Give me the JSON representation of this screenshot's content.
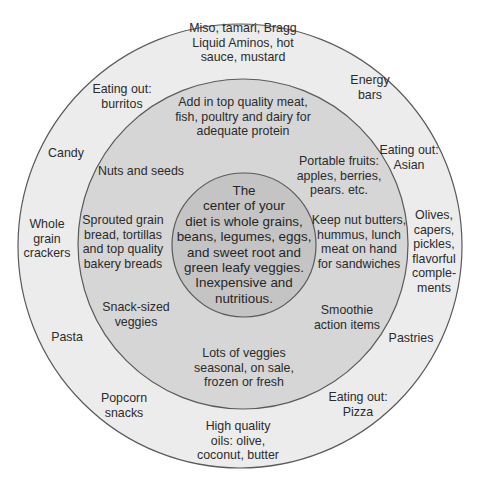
{
  "diagram": {
    "type": "concentric-circles",
    "colors": {
      "background": "#ffffff",
      "outer_ring_fill": "#ececec",
      "middle_ring_fill": "#d6d6d6",
      "inner_circle_fill": "#c4c4c4",
      "stroke": "#5a5a5a"
    },
    "circles": {
      "outer": {
        "cx": 240,
        "cy": 246,
        "r": 222
      },
      "middle": {
        "cx": 243,
        "cy": 244,
        "r": 165
      },
      "inner": {
        "cx": 244,
        "cy": 245,
        "r": 72
      }
    },
    "center": {
      "text": "The\ncenter of your\ndiet is whole grains,\nbeans, legumes, eggs,\nand sweet root and\ngreen leafy veggies.\nInexpensive and\nnutritious."
    },
    "middle_ring": [
      {
        "id": "protein",
        "text": "Add in top quality meat,\nfish, poultry and dairy for\nadequate protein"
      },
      {
        "id": "nuts",
        "text": "Nuts and seeds"
      },
      {
        "id": "fruits",
        "text": "Portable fruits:\napples, berries,\npears. etc."
      },
      {
        "id": "breads",
        "text": "Sprouted grain\nbread, tortillas\nand top quality\nbakery breads"
      },
      {
        "id": "sandwiches",
        "text": "Keep nut butters,\nhummus, lunch\nmeat on hand\nfor sandwiches"
      },
      {
        "id": "snack-veggies",
        "text": "Snack-sized\nveggies"
      },
      {
        "id": "smoothie",
        "text": "Smoothie\naction items"
      },
      {
        "id": "lots-veggies",
        "text": "Lots of veggies\nseasonal, on sale,\nfrozen or fresh"
      }
    ],
    "outer_ring": [
      {
        "id": "condiments",
        "text": "Miso, tamari, Bragg\nLiquid Aminos, hot\nsauce, mustard"
      },
      {
        "id": "burritos",
        "text": "Eating out:\nburritos"
      },
      {
        "id": "energy-bars",
        "text": "Energy\nbars"
      },
      {
        "id": "candy",
        "text": "Candy"
      },
      {
        "id": "asian",
        "text": "Eating out:\nAsian"
      },
      {
        "id": "crackers",
        "text": "Whole\ngrain\ncrackers"
      },
      {
        "id": "olives",
        "text": "Olives,\ncapers,\npickles,\nflavorful\ncomple-\nments"
      },
      {
        "id": "pasta",
        "text": "Pasta"
      },
      {
        "id": "pastries",
        "text": "Pastries"
      },
      {
        "id": "popcorn",
        "text": "Popcorn\nsnacks"
      },
      {
        "id": "pizza",
        "text": "Eating out:\nPizza"
      },
      {
        "id": "oils",
        "text": "High quality\noils:  olive,\ncoconut, butter"
      }
    ]
  }
}
